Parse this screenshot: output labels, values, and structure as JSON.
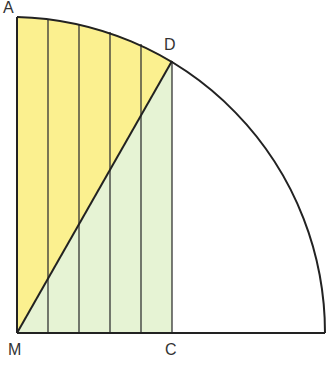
{
  "diagram": {
    "title": "",
    "points": {
      "A": "A",
      "D": "D",
      "M": "M",
      "C": "C"
    },
    "colors": {
      "yellow_region": "#fbf08f",
      "green_region": "#e6f3d4",
      "stroke": "#222222"
    }
  }
}
